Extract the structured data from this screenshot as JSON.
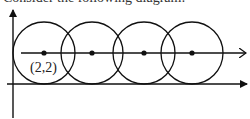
{
  "caption": "Consider the following diagram:",
  "diagram": {
    "y_axis": {
      "x": 13,
      "y_top": 10,
      "y_bottom": 118,
      "arrow": "filled"
    },
    "x_axis": {
      "y": 84,
      "x_start": 7,
      "x_end": 247,
      "arrow": "filled"
    },
    "center_line": {
      "y": 53,
      "x_start": 21,
      "x_end": 246,
      "arrow": "open"
    },
    "circle_radius": 31,
    "circles": [
      {
        "cx": 44,
        "cy": 53
      },
      {
        "cx": 92,
        "cy": 53
      },
      {
        "cx": 144,
        "cy": 53
      },
      {
        "cx": 192,
        "cy": 53
      }
    ],
    "labels": [
      {
        "text": "(2,2)",
        "x": 30,
        "y": 72,
        "refers_to": "first circle center"
      }
    ]
  },
  "colors": {
    "stroke": "#111111",
    "background": "#ffffff"
  }
}
